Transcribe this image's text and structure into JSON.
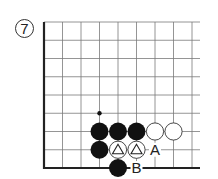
{
  "diagram": {
    "number_label": "7",
    "grid": {
      "cols": 9,
      "rows": 9,
      "origin_x": 44,
      "origin_y": 22,
      "spacing_x": 18.5,
      "spacing_y": 18.25,
      "edges": [
        "left",
        "bottom"
      ],
      "line_color": "#7a7a7a",
      "edge_color": "#222222"
    },
    "stones": [
      {
        "color": "black",
        "col": 3,
        "row": 6
      },
      {
        "color": "black",
        "col": 4,
        "row": 6
      },
      {
        "color": "black",
        "col": 5,
        "row": 6
      },
      {
        "color": "white",
        "col": 6,
        "row": 6
      },
      {
        "color": "white",
        "col": 7,
        "row": 6
      },
      {
        "color": "black",
        "col": 3,
        "row": 7
      },
      {
        "color": "white",
        "col": 4,
        "row": 7,
        "mark": "triangle"
      },
      {
        "color": "white",
        "col": 5,
        "row": 7,
        "mark": "triangle"
      },
      {
        "color": "black",
        "col": 4,
        "row": 8
      }
    ],
    "marks": [
      {
        "type": "dot",
        "col": 3,
        "row": 5
      }
    ],
    "point_labels": [
      {
        "text": "A",
        "col": 6,
        "row": 7
      },
      {
        "text": "B",
        "col": 5,
        "row": 8
      }
    ]
  }
}
